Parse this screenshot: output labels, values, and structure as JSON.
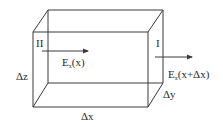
{
  "diagram": {
    "title": "",
    "colors": {
      "line": "#3a3a3a",
      "text": "#2a2a2a",
      "background": "#ffffff"
    },
    "faces": {
      "left": "II",
      "right": "I"
    },
    "field_left": {
      "symbol": "E",
      "subscript": "x",
      "argument": "(x)"
    },
    "field_right": {
      "symbol": "E",
      "subscript": "x",
      "argument": "(x+Δx)"
    },
    "dimensions": {
      "dx": "Δx",
      "dy": "Δy",
      "dz": "Δz"
    },
    "arrows": [
      {
        "name": "field-arrow-left",
        "direction": "right"
      },
      {
        "name": "field-arrow-right",
        "direction": "right"
      }
    ]
  }
}
